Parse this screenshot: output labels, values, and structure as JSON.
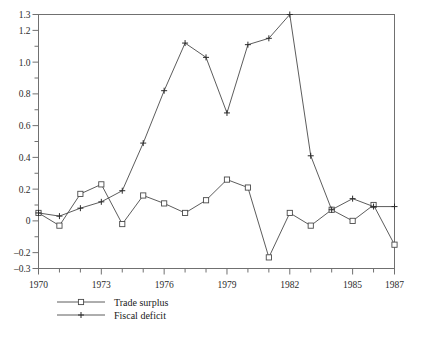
{
  "chart_data": {
    "type": "line",
    "title": "",
    "xlabel": "",
    "ylabel": "",
    "xlim": [
      1970,
      1987
    ],
    "ylim": [
      -0.3,
      1.3
    ],
    "grid": false,
    "legend_position": "below-left",
    "x": [
      1970,
      1971,
      1972,
      1973,
      1974,
      1975,
      1976,
      1977,
      1978,
      1979,
      1980,
      1981,
      1982,
      1983,
      1984,
      1985,
      1986,
      1987
    ],
    "xticks": [
      1970,
      1973,
      1976,
      1979,
      1982,
      1985,
      1987
    ],
    "xtick_labels": [
      "1970",
      "1973",
      "1976",
      "1979",
      "1982",
      "1985",
      "1987"
    ],
    "yticks": [
      -0.3,
      -0.2,
      -0.1,
      0,
      0.1,
      0.2,
      0.3,
      0.4,
      0.5,
      0.6,
      0.7,
      0.8,
      0.9,
      1.0,
      1.1,
      1.2,
      1.3
    ],
    "ytick_labels": [
      "-0.3",
      "-0.2",
      "",
      "0",
      "",
      "0.2",
      "",
      "0.4",
      "",
      "0.6",
      "",
      "0.8",
      "",
      "1.0",
      "",
      "1.2",
      "1.3"
    ],
    "series": [
      {
        "name": "Trade surplus",
        "marker": "open-square",
        "values": [
          0.05,
          -0.03,
          0.17,
          0.23,
          -0.02,
          0.16,
          0.11,
          0.05,
          0.13,
          0.26,
          0.21,
          -0.23,
          0.05,
          -0.03,
          0.07,
          0.0,
          0.1,
          -0.15
        ]
      },
      {
        "name": "Fiscal deficit",
        "marker": "plus",
        "values": [
          0.05,
          0.03,
          0.08,
          0.12,
          0.19,
          0.49,
          0.82,
          1.12,
          1.03,
          0.68,
          1.11,
          1.15,
          1.3,
          0.41,
          0.07,
          0.14,
          0.09,
          0.09
        ]
      }
    ]
  },
  "legend": {
    "items": [
      {
        "label": "Trade surplus",
        "marker": "open-square"
      },
      {
        "label": "Fiscal deficit",
        "marker": "plus"
      }
    ]
  },
  "colors": {
    "line": "#4a4a4a",
    "frame": "#707070",
    "text": "#1a1a1a",
    "background": "#ffffff"
  }
}
